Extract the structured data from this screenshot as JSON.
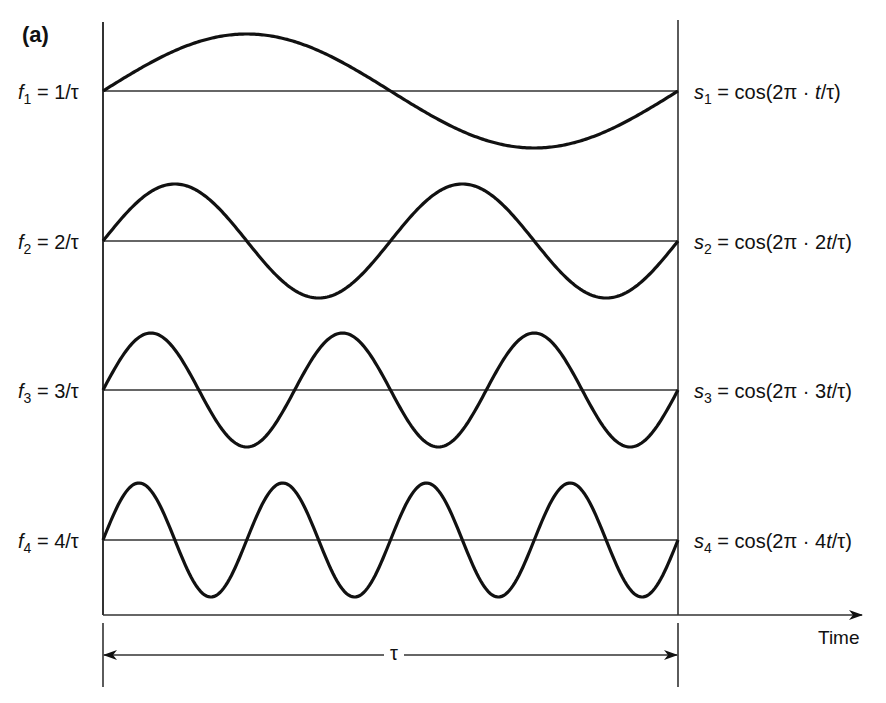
{
  "figure": {
    "panel_label": "(a)",
    "time_axis_label": "Time",
    "period_label": "τ",
    "rows": [
      {
        "freq_var": "f",
        "freq_sub": "1",
        "freq_value": " = 1/τ",
        "sig_var": "s",
        "sig_sub": "1",
        "sig_expr_pre": " = cos(2π · ",
        "sig_expr_t": "t",
        "sig_expr_post": "/τ)",
        "coef": "",
        "cycles": 1
      },
      {
        "freq_var": "f",
        "freq_sub": "2",
        "freq_value": " = 2/τ",
        "sig_var": "s",
        "sig_sub": "2",
        "sig_expr_pre": " = cos(2π · 2",
        "sig_expr_t": "t",
        "sig_expr_post": "/τ)",
        "coef": "2",
        "cycles": 2
      },
      {
        "freq_var": "f",
        "freq_sub": "3",
        "freq_value": " = 3/τ",
        "sig_var": "s",
        "sig_sub": "3",
        "sig_expr_pre": " = cos(2π · 3",
        "sig_expr_t": "t",
        "sig_expr_post": "/τ)",
        "coef": "3",
        "cycles": 3
      },
      {
        "freq_var": "f",
        "freq_sub": "4",
        "freq_value": " = 4/τ",
        "sig_var": "s",
        "sig_sub": "4",
        "sig_expr_pre": " = cos(2π · 4",
        "sig_expr_t": "t",
        "sig_expr_post": "/τ)",
        "coef": "4",
        "cycles": 4
      }
    ],
    "colors": {
      "stroke": "#111111",
      "axis": "#333333",
      "background": "#ffffff"
    }
  }
}
